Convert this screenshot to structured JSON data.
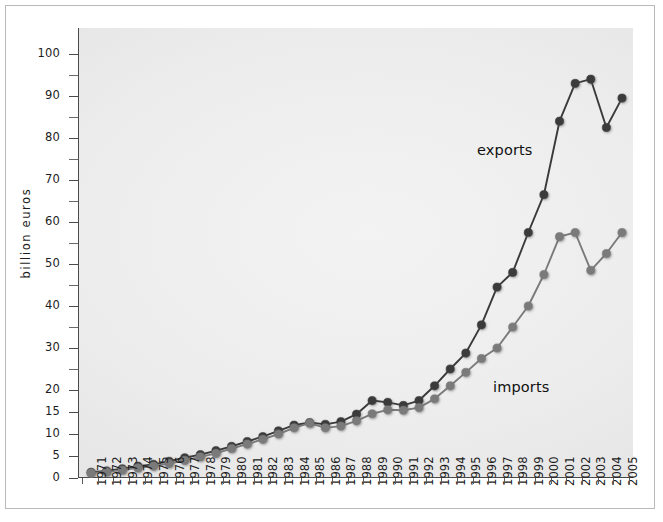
{
  "chart_data": {
    "type": "line",
    "title": "",
    "xlabel": "",
    "ylabel": "billion euros",
    "grid": false,
    "legend_position": "inline-annotation",
    "axis_note": "y-axis uses an expanded (broken) scale below 20: ticks 0,5,10,15,20 are equally spaced, then 20 to 100 in steps of 10 at the same spacing",
    "ylim": [
      0,
      100
    ],
    "y_major_ticks": [
      0,
      5,
      10,
      15,
      20,
      30,
      40,
      50,
      60,
      70,
      80,
      90,
      100
    ],
    "y_minor_ticks": [
      25,
      35,
      45,
      55,
      65,
      75,
      85,
      95
    ],
    "x": [
      "1971",
      "1972",
      "1973",
      "1974",
      "1975",
      "1976",
      "1977",
      "1978",
      "1979",
      "1980",
      "1981",
      "1982",
      "1983",
      "1984",
      "1985",
      "1986",
      "1987",
      "1988",
      "1989",
      "1990",
      "1991",
      "1992",
      "1993",
      "1994",
      "1995",
      "1996",
      "1997",
      "1998",
      "1999",
      "2000",
      "2001",
      "2002",
      "2003",
      "2004",
      "2005"
    ],
    "categories": [
      "1971",
      "1972",
      "1973",
      "1974",
      "1975",
      "1976",
      "1977",
      "1978",
      "1979",
      "1980",
      "1981",
      "1982",
      "1983",
      "1984",
      "1985",
      "1986",
      "1987",
      "1988",
      "1989",
      "1990",
      "1991",
      "1992",
      "1993",
      "1994",
      "1995",
      "1996",
      "1997",
      "1998",
      "1999",
      "2000",
      "2001",
      "2002",
      "2003",
      "2004",
      "2005"
    ],
    "series": [
      {
        "name": "exports",
        "color": "#3a3a3a",
        "values": [
          1.3,
          1.6,
          2.1,
          2.7,
          3.1,
          3.8,
          4.6,
          5.3,
          6.2,
          7.2,
          8.3,
          9.4,
          10.7,
          12.0,
          12.6,
          12.2,
          12.8,
          14.5,
          17.6,
          17.2,
          16.5,
          17.6,
          21.0,
          25.0,
          28.8,
          35.5,
          44.5,
          48.0,
          57.5,
          66.5,
          84.0,
          93.0,
          94.0,
          82.5,
          89.5
        ]
      },
      {
        "name": "imports",
        "color": "#7a7a7a",
        "values": [
          1.1,
          1.4,
          1.8,
          2.3,
          2.7,
          3.3,
          4.0,
          4.8,
          5.6,
          6.7,
          7.7,
          8.8,
          10.0,
          11.4,
          12.5,
          11.4,
          11.8,
          13.0,
          14.6,
          15.5,
          15.4,
          16.0,
          18.0,
          21.0,
          24.2,
          27.5,
          30.0,
          35.0,
          40.0,
          47.5,
          56.5,
          57.5,
          48.5,
          52.5,
          57.5
        ]
      }
    ],
    "annotations": [
      {
        "text": "exports",
        "series": "exports",
        "x_px": 477,
        "y_px": 142
      },
      {
        "text": "imports",
        "series": "imports",
        "x_px": 493,
        "y_px": 379
      }
    ]
  },
  "labels": {
    "exports": "exports",
    "imports": "imports",
    "y_axis_title": "billion euros"
  }
}
